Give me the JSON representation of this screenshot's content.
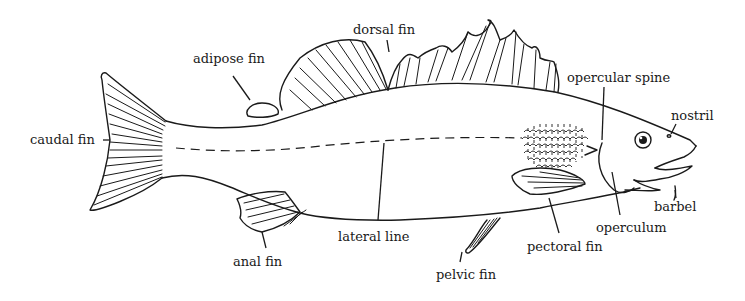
{
  "diagram": {
    "labels": {
      "dorsal_fin": "dorsal fin",
      "adipose_fin": "adipose fin",
      "caudal_fin": "caudal fin",
      "opercular_spine": "opercular spine",
      "nostril": "nostril",
      "barbel": "barbel",
      "operculum": "operculum",
      "pectoral_fin": "pectoral fin",
      "pelvic_fin": "pelvic fin",
      "lateral_line": "lateral line",
      "anal_fin": "anal fin"
    },
    "colors": {
      "ink": "#1a1a1a",
      "background": "#ffffff"
    }
  }
}
